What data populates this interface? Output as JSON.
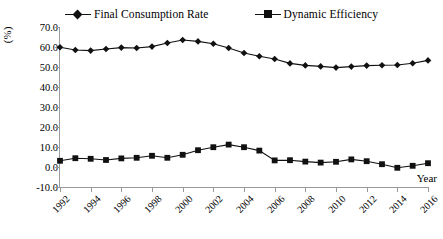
{
  "chart_data": {
    "type": "line",
    "title": "",
    "xlabel": "Year",
    "ylabel": "(%)",
    "ylim": [
      -10.0,
      70.0
    ],
    "ytick_labels": [
      "70.0",
      "60.0",
      "50.0",
      "40.0",
      "30.0",
      "20.0",
      "10.0",
      "0.0",
      "-10.0"
    ],
    "ytick_values": [
      70,
      60,
      50,
      40,
      30,
      20,
      10,
      0,
      -10
    ],
    "grid": false,
    "legend_position": "top-center",
    "x": [
      1992,
      1993,
      1994,
      1995,
      1996,
      1997,
      1998,
      1999,
      2000,
      2001,
      2002,
      2003,
      2004,
      2005,
      2006,
      2007,
      2008,
      2009,
      2010,
      2011,
      2012,
      2013,
      2014,
      2015,
      2016
    ],
    "xtick_labels": [
      "1992",
      "1994",
      "1996",
      "1998",
      "2000",
      "2002",
      "2004",
      "2006",
      "2008",
      "2010",
      "2012",
      "2014",
      "2016"
    ],
    "xtick_values": [
      1992,
      1994,
      1996,
      1998,
      2000,
      2002,
      2004,
      2006,
      2008,
      2010,
      2012,
      2014,
      2016
    ],
    "series": [
      {
        "name": "Final Consumption Rate",
        "marker": "diamond",
        "color": "#111111",
        "values": [
          59.9,
          58.5,
          58.2,
          59.0,
          59.7,
          59.5,
          60.2,
          62.0,
          63.5,
          62.8,
          61.6,
          59.5,
          57.0,
          55.4,
          54.0,
          51.8,
          50.8,
          50.3,
          49.7,
          50.2,
          50.7,
          50.9,
          51.0,
          51.9,
          53.3
        ]
      },
      {
        "name": "Dynamic Efficiency",
        "marker": "square",
        "color": "#111111",
        "values": [
          3.1,
          4.4,
          4.1,
          3.5,
          4.3,
          4.6,
          5.6,
          4.6,
          6.1,
          8.4,
          9.9,
          11.2,
          9.9,
          8.2,
          3.3,
          3.4,
          2.7,
          2.2,
          2.6,
          3.8,
          2.9,
          1.4,
          -0.4,
          0.6,
          1.9
        ]
      }
    ]
  },
  "legend": {
    "entries": [
      {
        "label": "Final Consumption Rate"
      },
      {
        "label": "Dynamic Efficiency"
      }
    ]
  }
}
